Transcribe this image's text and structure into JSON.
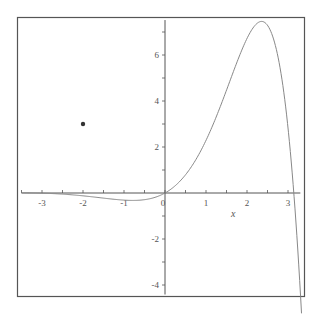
{
  "chart_data": {
    "type": "line",
    "title": "",
    "xlabel": "x",
    "ylabel": "",
    "xlim": [
      -3.5,
      3.35
    ],
    "ylim": [
      -4.5,
      7.65
    ],
    "grid": false,
    "legend": null,
    "x_ticks": [
      -3,
      -2,
      -1,
      0,
      1,
      2,
      3
    ],
    "x_tick_labels": [
      "-3",
      "-2",
      "-1",
      "0",
      "1",
      "2",
      "3"
    ],
    "y_ticks": [
      -4,
      -2,
      2,
      4,
      6
    ],
    "y_tick_labels": [
      "-4",
      "-2",
      "2",
      "4",
      "6"
    ],
    "series": [
      {
        "name": "curve",
        "expression": "exp(x)*sin(x)",
        "x": [
          -3.5,
          -3.0,
          -2.5,
          -2.0,
          -1.5,
          -1.0,
          -0.785,
          -0.5,
          0,
          0.5,
          1.0,
          1.5,
          2.0,
          2.356,
          2.5,
          2.75,
          3.0,
          3.14,
          3.25,
          3.33
        ],
        "y": [
          0.01,
          -0.01,
          -0.05,
          -0.12,
          -0.22,
          -0.31,
          -0.32,
          -0.29,
          0,
          0.79,
          2.29,
          4.46,
          6.72,
          7.46,
          7.3,
          6.0,
          2.83,
          0.05,
          -2.8,
          -4.9
        ],
        "color": "#888888"
      },
      {
        "name": "point",
        "type": "scatter",
        "x": [
          -2
        ],
        "y": [
          3
        ],
        "color": "#333333"
      }
    ]
  },
  "frame": {
    "border_color": "#555555"
  }
}
